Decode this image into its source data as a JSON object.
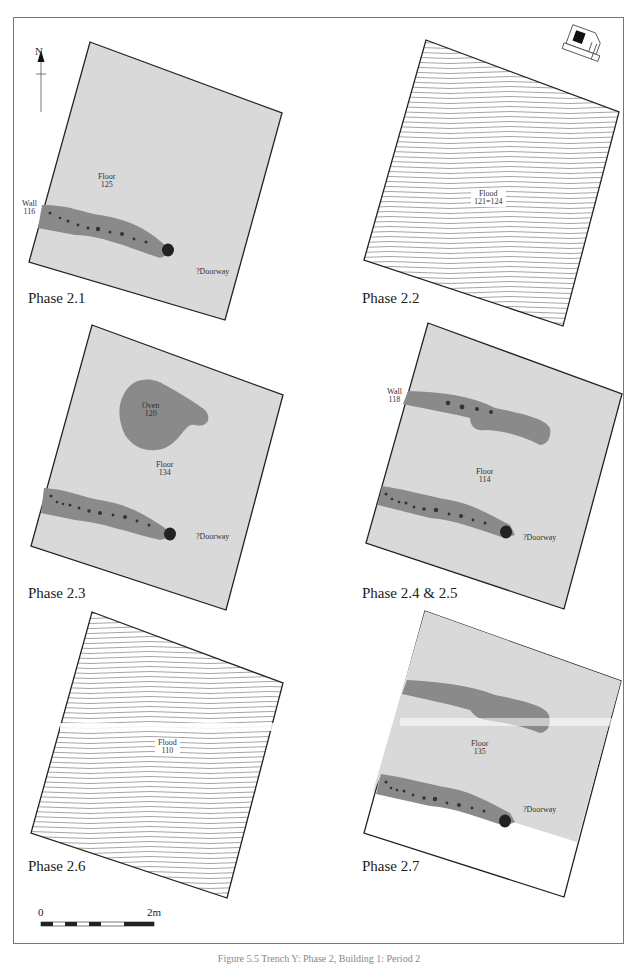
{
  "figure": {
    "caption": "Figure 5.5 Trench Y: Phase 2, Building 1: Period 2",
    "north_label": "N",
    "scale": {
      "start": "0",
      "end": "2m"
    }
  },
  "panels": [
    {
      "id": "phase-2-1",
      "phase": "Phase 2.1",
      "fill": "floor",
      "labels": {
        "floor": "Floor\n125",
        "wall": "Wall\n116",
        "doorway": "?Doorway"
      }
    },
    {
      "id": "phase-2-2",
      "phase": "Phase 2.2",
      "fill": "flood",
      "labels": {
        "flood": "Flood\n121=124"
      }
    },
    {
      "id": "phase-2-3",
      "phase": "Phase 2.3",
      "fill": "floor",
      "labels": {
        "oven": "Oven\n120",
        "floor": "Floor\n134",
        "doorway": "?Doorway"
      }
    },
    {
      "id": "phase-2-4-2-5",
      "phase": "Phase 2.4 & 2.5",
      "fill": "floor",
      "labels": {
        "wall": "Wall\n118",
        "floor": "Floor\n114",
        "doorway": "?Doorway"
      }
    },
    {
      "id": "phase-2-6",
      "phase": "Phase 2.6",
      "fill": "flood",
      "labels": {
        "flood": "Flood\n110"
      }
    },
    {
      "id": "phase-2-7",
      "phase": "Phase 2.7",
      "fill": "floor",
      "labels": {
        "floor": "Floor\n135",
        "doorway": "?Doorway"
      }
    }
  ],
  "colors": {
    "floor": "#d9d9d9",
    "wall": "#8a8a8a",
    "stone": "#333333",
    "outline": "#222222",
    "flood_line": "#555555"
  }
}
